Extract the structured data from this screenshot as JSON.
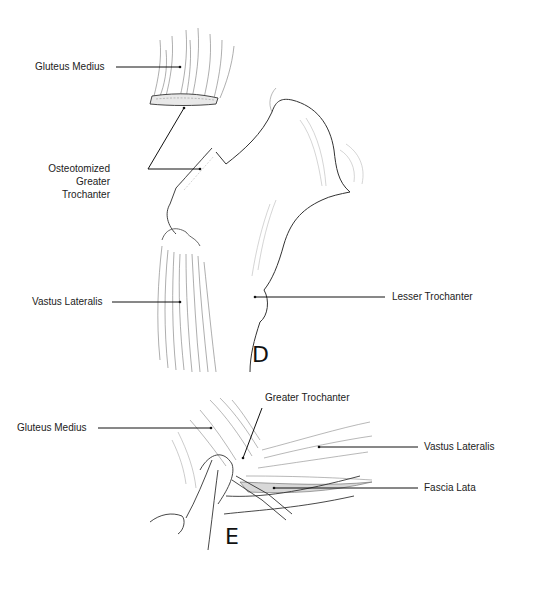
{
  "figure": {
    "panels": [
      {
        "id": "D",
        "letter": "D",
        "labels": [
          {
            "text": "Gluteus Medius"
          },
          {
            "text": "Osteotomized"
          },
          {
            "text": "Greater"
          },
          {
            "text": "Trochanter"
          },
          {
            "text": "Vastus Lateralis"
          },
          {
            "text": "Lesser Trochanter"
          }
        ]
      },
      {
        "id": "E",
        "letter": "E",
        "labels": [
          {
            "text": "Greater Trochanter"
          },
          {
            "text": "Gluteus Medius"
          },
          {
            "text": "Vastus Lateralis"
          },
          {
            "text": "Fascia Lata"
          }
        ]
      }
    ],
    "colors": {
      "line": "#222222",
      "shade": "#9a9a9a",
      "background": "#ffffff"
    }
  }
}
